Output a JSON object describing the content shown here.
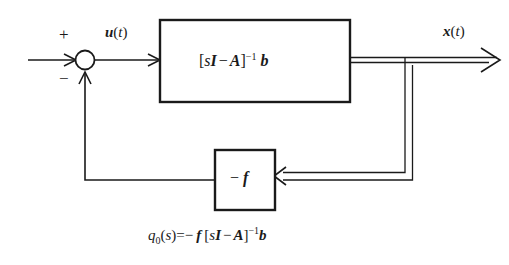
{
  "diagram": {
    "type": "control-block-diagram",
    "background_color": "#ffffff",
    "line_color": "#1a1a1a",
    "signals": {
      "input_label": "",
      "error_label": {
        "symbol": "u",
        "paren_open": "(",
        "arg": "t",
        "paren_close": ")"
      },
      "output_label": {
        "symbol": "x",
        "paren_open": "(",
        "arg": "t",
        "paren_close": ")"
      }
    },
    "summing_junction": {
      "name": "summing-junction",
      "plus_sign": "+",
      "minus_sign": "−"
    },
    "plant_block": {
      "name": "plant-transfer-block",
      "bracket_open": "[",
      "term_s": "s",
      "term_I": "I",
      "op_minus": "−",
      "term_A": "A",
      "bracket_close": "]",
      "exponent": "−1",
      "term_b": "b"
    },
    "feedback_block": {
      "name": "feedback-gain-block",
      "op_minus": "−",
      "term_f": "f"
    },
    "caption": {
      "q": "q",
      "subscript": "0",
      "paren_open": "(",
      "arg_s": "s",
      "paren_close": ")",
      "equals": "=",
      "op_minus_1": "−",
      "term_f": "f",
      "bracket_open": "[",
      "term_s": "s",
      "term_I": "I",
      "op_minus_2": "−",
      "term_A": "A",
      "bracket_close": "]",
      "exponent": "−1",
      "term_b": "b"
    }
  }
}
